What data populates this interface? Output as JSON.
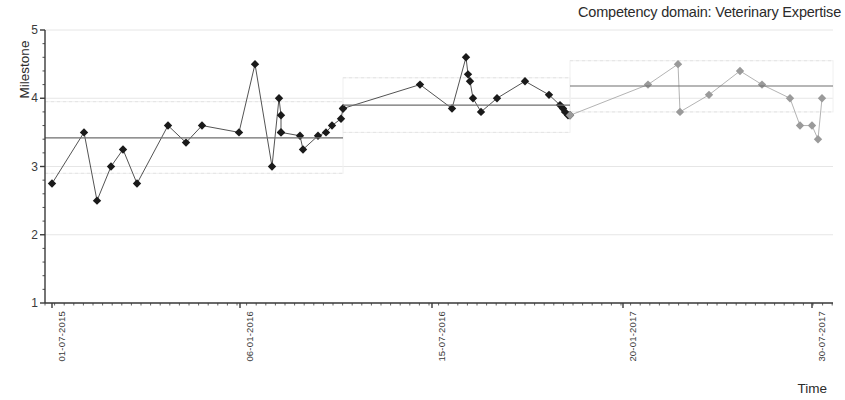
{
  "chart_data": {
    "type": "scatter",
    "title": "Competency domain: Veterinary Expertise",
    "xlabel": "Time",
    "ylabel": "Milestone",
    "ylim": [
      1,
      5
    ],
    "yticks": [
      1,
      2,
      3,
      4,
      5
    ],
    "xticks": [
      "01-07-2015",
      "06-01-2016",
      "15-07-2016",
      "20-01-2017",
      "30-07-2017"
    ],
    "xtick_px": [
      52,
      240,
      432,
      623,
      812
    ],
    "grid": true,
    "legend": "none",
    "colors": {
      "dark_series": "#1a1a1a",
      "light_series": "#9a9a9a",
      "reference_line": "#6e6e6e",
      "grid": "#e6e6e6",
      "axis": "#3a3a3a"
    },
    "series": [
      {
        "name": "Phase 1 observations",
        "color": "#1a1a1a",
        "x": [
          52,
          84,
          97,
          111,
          123,
          137,
          168,
          186,
          202,
          239,
          255,
          272,
          279,
          281,
          281,
          281,
          300,
          303,
          318,
          326,
          332,
          341,
          343
        ],
        "values": [
          2.75,
          3.5,
          2.5,
          3.0,
          3.25,
          2.75,
          3.6,
          3.35,
          3.6,
          3.5,
          4.5,
          3.0,
          4.0,
          3.75,
          3.5,
          3.5,
          3.45,
          3.25,
          3.45,
          3.5,
          3.6,
          3.7,
          3.85
        ]
      },
      {
        "name": "Phase 2 observations",
        "color": "#1a1a1a",
        "x": [
          343,
          420,
          452,
          466,
          468,
          470,
          473,
          481,
          497,
          525,
          549,
          560,
          563,
          565,
          568,
          570
        ],
        "values": [
          3.85,
          4.2,
          3.85,
          4.6,
          4.35,
          4.25,
          4.0,
          3.8,
          4.0,
          4.25,
          4.05,
          3.9,
          3.85,
          3.8,
          3.75,
          3.75
        ]
      },
      {
        "name": "Phase 3 observations",
        "color": "#9a9a9a",
        "x": [
          570,
          648,
          678,
          680,
          709,
          740,
          762,
          790,
          800,
          812,
          818,
          822
        ],
        "values": [
          3.75,
          4.2,
          4.5,
          3.8,
          4.05,
          4.4,
          4.2,
          4.0,
          3.6,
          3.6,
          3.4,
          4.0
        ]
      }
    ],
    "reference_lines": [
      {
        "name": "segment-1-mean",
        "x_start": 45,
        "x_end": 343,
        "value": 3.42
      },
      {
        "name": "segment-2-mean",
        "x_start": 343,
        "x_end": 570,
        "value": 3.9
      },
      {
        "name": "segment-3-mean",
        "x_start": 570,
        "x_end": 833,
        "value": 4.18
      }
    ],
    "confidence_bands": [
      {
        "name": "segment-1-band",
        "x_start": 45,
        "x_end": 343,
        "upper": 3.95,
        "lower": 2.9
      },
      {
        "name": "segment-2-band",
        "x_start": 343,
        "x_end": 570,
        "upper": 4.3,
        "lower": 3.5
      },
      {
        "name": "segment-3-band",
        "x_start": 570,
        "x_end": 833,
        "upper": 4.55,
        "lower": 3.8
      }
    ]
  }
}
